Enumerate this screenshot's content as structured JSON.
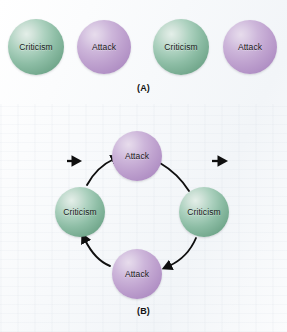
{
  "figure": {
    "background_color": "#fbfcfd",
    "node_colors": {
      "criticism": "#7fb39a",
      "attack": "#bb9ccd",
      "arrow": "#0f0f0f",
      "label_text": "#1a1a1a"
    },
    "panels": [
      {
        "id": "A",
        "caption": "(A)",
        "layout": "linear-chain",
        "nodes": [
          {
            "id": "a-node-1",
            "label": "Criticism",
            "type": "criticism",
            "cx": 36,
            "cy": 47,
            "r": 28
          },
          {
            "id": "a-node-2",
            "label": "Attack",
            "type": "attack",
            "cx": 104,
            "cy": 47,
            "r": 27
          },
          {
            "id": "a-node-3",
            "label": "Criticism",
            "type": "criticism",
            "cx": 181,
            "cy": 47,
            "r": 28
          },
          {
            "id": "a-node-4",
            "label": "Attack",
            "type": "attack",
            "cx": 250,
            "cy": 47,
            "r": 27
          }
        ],
        "connectors": [
          {
            "id": "a-arrow-1",
            "from": "a-node-1",
            "to": "a-node-2",
            "style": "straight",
            "direction": "right"
          },
          {
            "id": "a-arrow-2",
            "from": "a-node-2",
            "to": "a-node-3",
            "style": "straight",
            "direction": "right"
          },
          {
            "id": "a-arrow-3",
            "from": "a-node-3",
            "to": "a-node-4",
            "style": "straight",
            "direction": "right"
          }
        ]
      },
      {
        "id": "B",
        "caption": "(B)",
        "layout": "cycle",
        "nodes": [
          {
            "id": "b-node-top",
            "label": "Attack",
            "type": "attack",
            "cx": 137,
            "cy": 156,
            "r": 25
          },
          {
            "id": "b-node-right",
            "label": "Criticism",
            "type": "criticism",
            "cx": 204,
            "cy": 212,
            "r": 25
          },
          {
            "id": "b-node-bottom",
            "label": "Attack",
            "type": "attack",
            "cx": 137,
            "cy": 274,
            "r": 25
          },
          {
            "id": "b-node-left",
            "label": "Criticism",
            "type": "criticism",
            "cx": 80,
            "cy": 212,
            "r": 25
          }
        ],
        "connectors": [
          {
            "id": "b-arrow-right-bottom",
            "from": "b-node-right",
            "to": "b-node-bottom",
            "style": "curved",
            "direction": "down-left",
            "arrowhead": true
          },
          {
            "id": "b-arrow-bottom-left",
            "from": "b-node-bottom",
            "to": "b-node-left",
            "style": "curved",
            "direction": "up-left",
            "arrowhead": true
          },
          {
            "id": "b-arrow-left-top",
            "from": "b-node-left",
            "to": "b-node-top",
            "style": "curved",
            "direction": "up-right",
            "arrowhead": true
          },
          {
            "id": "b-arrow-top-right",
            "from": "b-node-top",
            "to": "b-node-right",
            "style": "curved",
            "direction": "down-right",
            "arrowhead": false
          }
        ]
      }
    ]
  }
}
